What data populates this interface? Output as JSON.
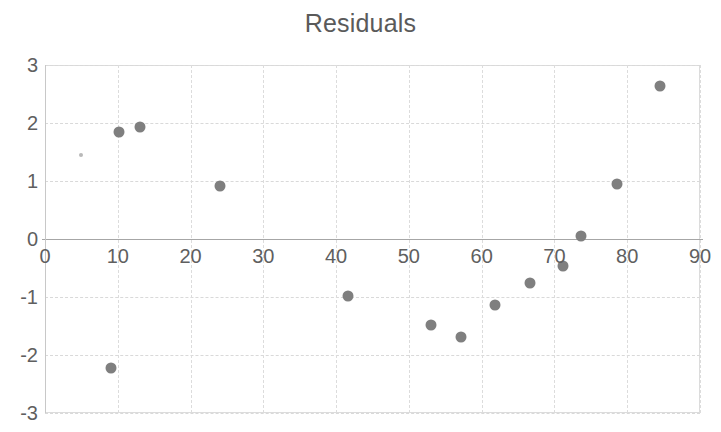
{
  "chart_data": {
    "type": "scatter",
    "title": "Residuals",
    "xlabel": "",
    "ylabel": "",
    "xlim": [
      0,
      90
    ],
    "ylim": [
      -3,
      3
    ],
    "grid": true,
    "legend": false,
    "marker_color": "#7f7f7f",
    "x_ticks": [
      0,
      10,
      20,
      30,
      40,
      50,
      60,
      70,
      80,
      90
    ],
    "y_ticks": [
      3,
      2,
      1,
      0,
      -1,
      -2,
      -3
    ],
    "x_tick_labels": [
      "0",
      "10",
      "20",
      "30",
      "40",
      "50",
      "60",
      "70",
      "80",
      "90"
    ],
    "y_tick_labels": [
      "3",
      "2",
      "1",
      "0",
      "-1",
      "-2",
      "-3"
    ],
    "series": [
      {
        "name": "Residuals",
        "points": [
          {
            "x": 5.0,
            "y": 1.45,
            "size": "tiny"
          },
          {
            "x": 9.0,
            "y": -2.23,
            "size": "normal"
          },
          {
            "x": 10.1,
            "y": 1.84,
            "size": "normal"
          },
          {
            "x": 13.0,
            "y": 1.93,
            "size": "normal"
          },
          {
            "x": 24.0,
            "y": 0.92,
            "size": "normal"
          },
          {
            "x": 41.7,
            "y": -0.99,
            "size": "normal"
          },
          {
            "x": 53.1,
            "y": -1.49,
            "size": "normal"
          },
          {
            "x": 57.2,
            "y": -1.69,
            "size": "normal"
          },
          {
            "x": 61.8,
            "y": -1.13,
            "size": "normal"
          },
          {
            "x": 66.6,
            "y": -0.75,
            "size": "normal"
          },
          {
            "x": 71.2,
            "y": -0.47,
            "size": "normal"
          },
          {
            "x": 73.7,
            "y": 0.05,
            "size": "normal"
          },
          {
            "x": 78.6,
            "y": 0.94,
            "size": "normal"
          },
          {
            "x": 84.5,
            "y": 2.63,
            "size": "normal"
          }
        ]
      }
    ]
  }
}
